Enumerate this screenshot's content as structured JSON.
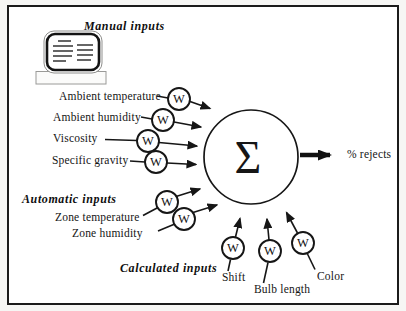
{
  "diagram": {
    "manual": {
      "title": "Manual inputs",
      "items": [
        "Ambient temperature",
        "Ambient humidity",
        "Viscosity",
        "Specific gravity"
      ]
    },
    "automatic": {
      "title": "Automatic inputs",
      "items": [
        "Zone temperature",
        "Zone humidity"
      ]
    },
    "calculated": {
      "title": "Calculated inputs",
      "items": [
        "Shift",
        "Bulb length",
        "Color"
      ]
    },
    "weight": "W",
    "sum": "Σ",
    "output": "% rejects",
    "icons": {
      "manual_source": "computer-terminal-icon"
    },
    "colors": {
      "ink": "#161616",
      "background": "#ffffff",
      "frame": "#1b1b1b"
    }
  }
}
